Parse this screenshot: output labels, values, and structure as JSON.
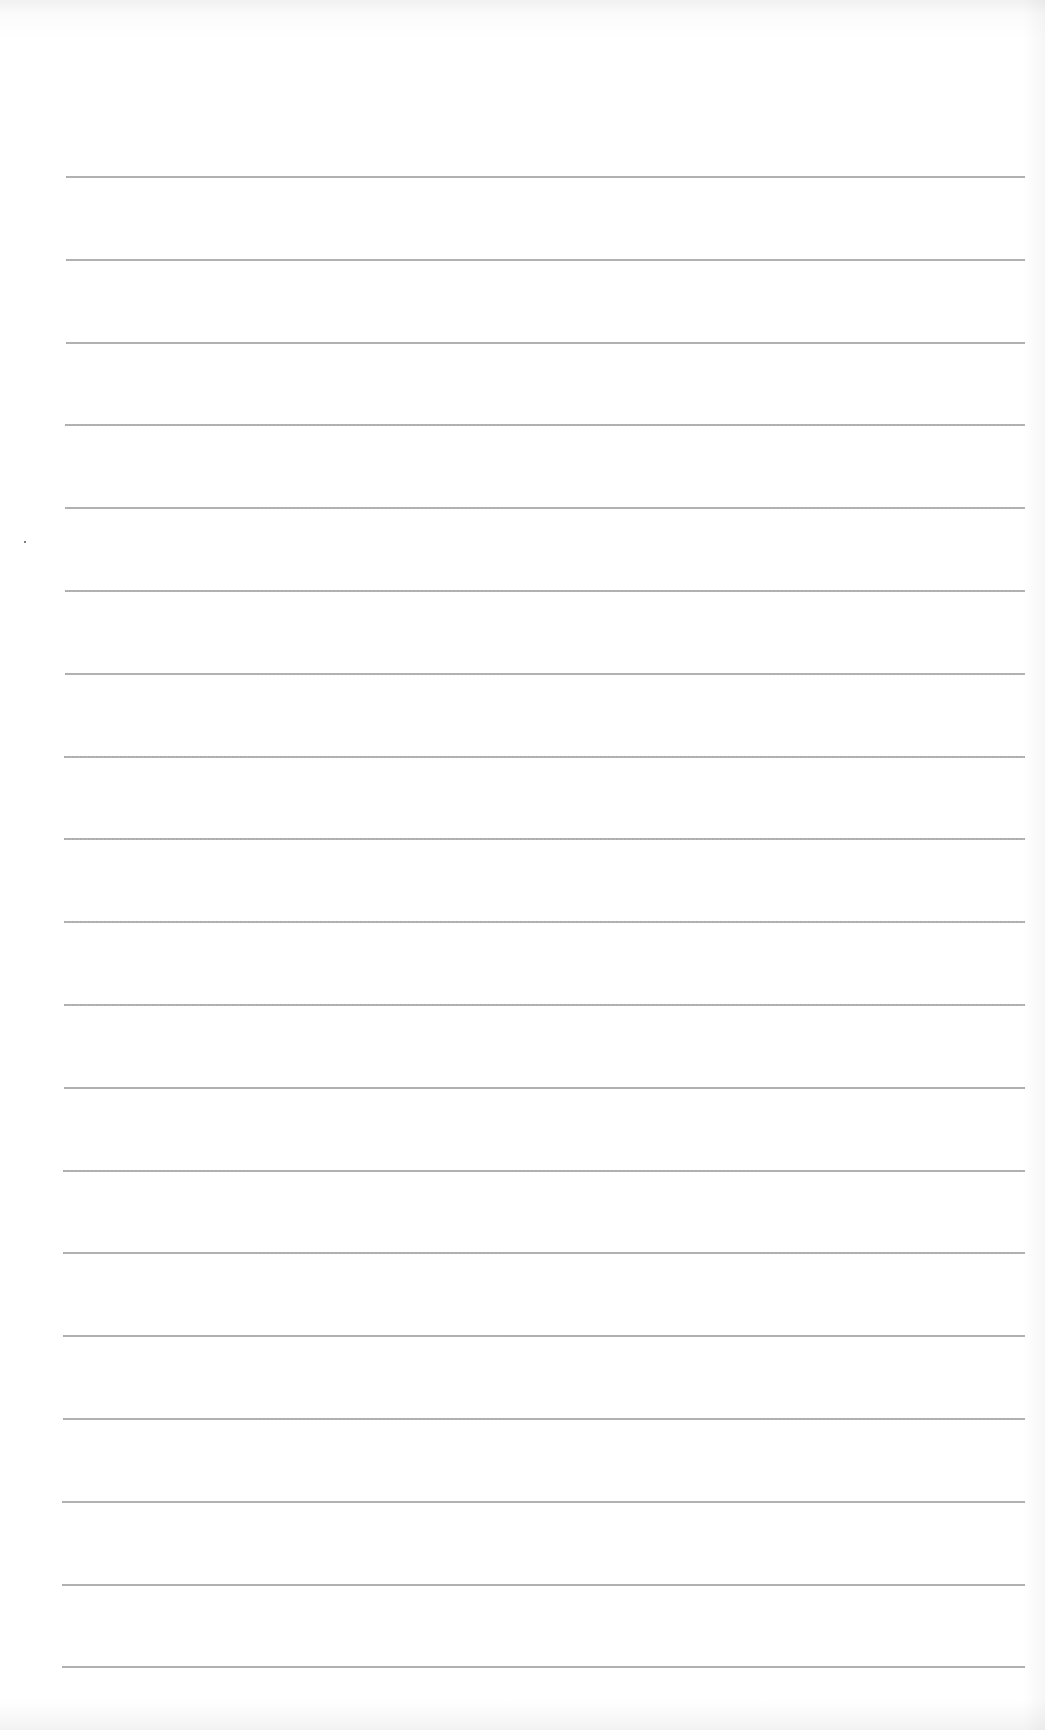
{
  "page": {
    "type": "ruled-paper",
    "background_color": "#ffffff",
    "line_color": "#a0a0a0"
  },
  "rules": {
    "count": 19,
    "first_y": 176,
    "spacing": 82.8,
    "left_x_top": 66,
    "left_x_bottom": 62,
    "right_x": 1025
  },
  "marks": [
    {
      "name": "speck",
      "x": 24,
      "y": 541
    }
  ]
}
